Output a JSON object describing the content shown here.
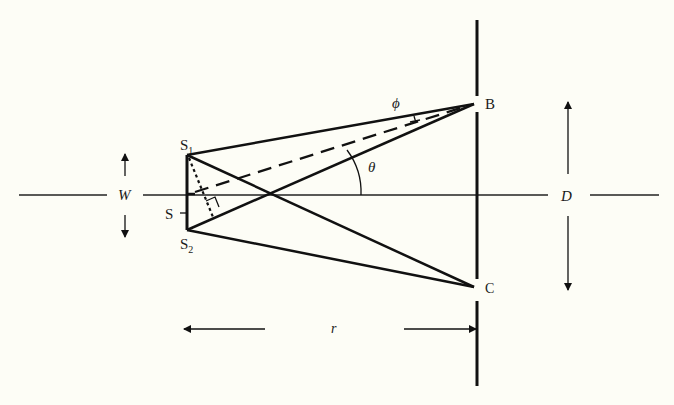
{
  "diagram": {
    "colors": {
      "background": "#fdfdf6",
      "ink": "#111111"
    },
    "labels": {
      "s1": "S",
      "s1_sub": "1",
      "s2": "S",
      "s2_sub": "2",
      "s": "S",
      "b": "B",
      "c": "C",
      "w": "W",
      "d": "D",
      "r": "r",
      "theta": "θ",
      "phi": "ϕ"
    },
    "points": {
      "S1": [
        187,
        155
      ],
      "S2": [
        187,
        230
      ],
      "S_mid": [
        187,
        194
      ],
      "B": [
        474,
        104
      ],
      "C": [
        474,
        287
      ],
      "crossing": [
        270,
        194
      ]
    },
    "dimensions": {
      "W": "separation of sources S1 and S2",
      "D": "separation of screen points B and C",
      "r": "distance from sources to screen"
    }
  }
}
